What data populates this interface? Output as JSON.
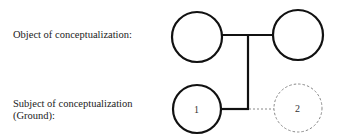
{
  "labels": {
    "object": "Object of conceptualization:",
    "subject_line1": "Subject of conceptualization",
    "subject_line2": "(Ground):"
  },
  "nodes": [
    {
      "id": "object-left",
      "label": "",
      "style": "solid"
    },
    {
      "id": "object-right",
      "label": "",
      "style": "solid"
    },
    {
      "id": "ground-1",
      "label": "1",
      "style": "solid"
    },
    {
      "id": "ground-2",
      "label": "2",
      "style": "dashed"
    }
  ],
  "colors": {
    "stroke": "#111111",
    "dashed_stroke": "#888888",
    "background": "#ffffff"
  }
}
